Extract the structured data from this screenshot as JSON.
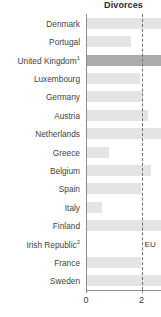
{
  "chart_data": {
    "type": "bar",
    "orientation": "horizontal",
    "title": "Divorces",
    "xlabel": "",
    "ylabel": "",
    "xlim": [
      0,
      2.7
    ],
    "xticks": [
      0,
      2
    ],
    "xticklabels": [
      "0",
      "2"
    ],
    "grid": false,
    "legend": null,
    "reference_line": {
      "label": "EU",
      "value": 2.0,
      "style": "dashed"
    },
    "highlight_category": "United Kingdom",
    "highlight_color": "#ababab",
    "bar_color": "#e4e4e4",
    "categories": [
      "Denmark",
      "Portugal",
      "United Kingdom",
      "Luxembourg",
      "Germany",
      "Austria",
      "Netherlands",
      "Greece",
      "Belgium",
      "Spain",
      "Italy",
      "Finland",
      "Irish Republic",
      "France",
      "Sweden"
    ],
    "category_labels": [
      "Denmark",
      "Portugal",
      "United Kingdom",
      "Luxembourg",
      "Germany",
      "Austria",
      "Netherlands",
      "Greece",
      "Belgium",
      "Spain",
      "Italy",
      "Finland",
      "Irish Republic",
      "France",
      "Sweden"
    ],
    "category_footnotes": [
      "",
      "",
      "1",
      "",
      "",
      "",
      "",
      "",
      "",
      "",
      "",
      "",
      "2",
      "",
      ""
    ],
    "values": [
      2.7,
      1.6,
      2.7,
      1.9,
      2.0,
      2.2,
      2.7,
      0.8,
      2.3,
      1.95,
      0.55,
      2.7,
      0.0,
      1.95,
      2.7
    ]
  }
}
